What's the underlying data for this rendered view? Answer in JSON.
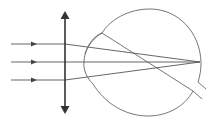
{
  "diagram": {
    "colors": {
      "stroke": "#555555",
      "lens": "#333333",
      "background": "#ffffff"
    },
    "rays": [
      {
        "y": 44
      },
      {
        "y": 62
      },
      {
        "y": 80
      }
    ],
    "focal_point": {
      "x": 200,
      "y": 62
    },
    "lens": {
      "x": 65,
      "top": 12,
      "bottom": 113
    }
  }
}
